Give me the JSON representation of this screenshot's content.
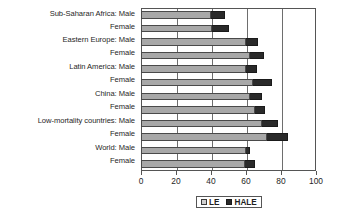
{
  "chart_data": {
    "type": "bar",
    "orientation": "horizontal",
    "title": "",
    "xlabel": "",
    "ylabel": "",
    "xlim": [
      0,
      100
    ],
    "xticks": [
      0,
      20,
      40,
      60,
      80,
      100
    ],
    "xtick_labels": [
      "0",
      "20",
      "40",
      "60",
      "80",
      "100"
    ],
    "grid": true,
    "grid_axis": "x",
    "legend": {
      "position": "bottom",
      "entries": [
        {
          "name": "LE",
          "color": "#a8a8a8"
        },
        {
          "name": "HALE",
          "color": "#2a2a2a"
        }
      ]
    },
    "categories": [
      "Sub-Saharan Africa: Male",
      "Female",
      "Eastern Europe: Male",
      "Female",
      "Latin America: Male",
      "Female",
      "China: Male",
      "Female",
      "Low-mortality countries: Male",
      "Female",
      "World: Male",
      "Female"
    ],
    "series": [
      {
        "name": "LE",
        "color": "#a8a8a8",
        "values": [
          40,
          40.5,
          60,
          62,
          60,
          64,
          62,
          65,
          69,
          72,
          60,
          59.5
        ]
      },
      {
        "name": "HALE",
        "color": "#2a2a2a",
        "values": [
          48,
          50,
          67,
          70,
          66,
          75,
          69,
          71,
          78,
          84,
          62,
          65
        ]
      }
    ]
  }
}
